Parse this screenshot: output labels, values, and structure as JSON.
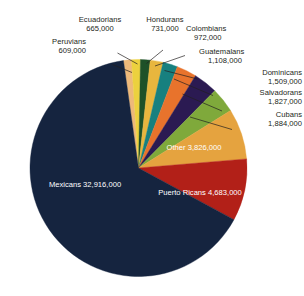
{
  "chart_data": {
    "type": "pie",
    "title": "",
    "subtitle": "",
    "xlabel": "",
    "ylabel": "",
    "legend_position": "none",
    "grid": false,
    "total": 50730000,
    "units": "people",
    "categories": [
      "Mexicans",
      "Puerto Ricans",
      "Other",
      "Cubans",
      "Salvadorans",
      "Dominicans",
      "Guatemalans",
      "Colombians",
      "Hondurans",
      "Ecuadorians",
      "Peruvians"
    ],
    "values": [
      32916000,
      4683000,
      3826000,
      1884000,
      1827000,
      1509000,
      1108000,
      972000,
      731000,
      665000,
      609000
    ],
    "labels": [
      "32,916,000",
      "4,683,000",
      "3,826,000",
      "1,884,000",
      "1,827,000",
      "1,509,000",
      "1,108,000",
      "972,000",
      "731,000",
      "665,000",
      "609,000"
    ],
    "colors": [
      "#15243f",
      "#b22018",
      "#e5a33f",
      "#7fa93b",
      "#2b1a52",
      "#e8732c",
      "#17807f",
      "#e8b63e",
      "#1e5128",
      "#ecd13e",
      "#edb97a"
    ],
    "slices": [
      {
        "name": "Mexicans",
        "value": 32916000,
        "label": "32,916,000",
        "color": "#15243f",
        "label_placement": "inside",
        "label_color": "#ffffff"
      },
      {
        "name": "Puerto Ricans",
        "value": 4683000,
        "label": "4,683,000",
        "color": "#b22018",
        "label_placement": "inside",
        "label_color": "#ffffff"
      },
      {
        "name": "Other",
        "value": 3826000,
        "label": "3,826,000",
        "color": "#e5a33f",
        "label_placement": "inside",
        "label_color": "#ffffff"
      },
      {
        "name": "Cubans",
        "value": 1884000,
        "label": "1,884,000",
        "color": "#7fa93b",
        "label_placement": "callout",
        "label_color": "#231f20"
      },
      {
        "name": "Salvadorans",
        "value": 1827000,
        "label": "1,827,000",
        "color": "#2b1a52",
        "label_placement": "callout",
        "label_color": "#231f20"
      },
      {
        "name": "Dominicans",
        "value": 1509000,
        "label": "1,509,000",
        "color": "#e8732c",
        "label_placement": "callout",
        "label_color": "#231f20"
      },
      {
        "name": "Guatemalans",
        "value": 1108000,
        "label": "1,108,000",
        "color": "#17807f",
        "label_placement": "callout",
        "label_color": "#231f20"
      },
      {
        "name": "Colombians",
        "value": 972000,
        "label": "972,000",
        "color": "#e8b63e",
        "label_placement": "callout",
        "label_color": "#231f20"
      },
      {
        "name": "Hondurans",
        "value": 731000,
        "label": "731,000",
        "color": "#1e5128",
        "label_placement": "callout",
        "label_color": "#231f20"
      },
      {
        "name": "Ecuadorians",
        "value": 665000,
        "label": "665,000",
        "color": "#ecd13e",
        "label_placement": "callout",
        "label_color": "#231f20"
      },
      {
        "name": "Peruvians",
        "value": 609000,
        "label": "609,000",
        "color": "#edb97a",
        "label_placement": "callout",
        "label_color": "#231f20"
      }
    ]
  },
  "callouts": {
    "peruvians": {
      "name": "Peruvians",
      "value": "609,000"
    },
    "ecuadorians": {
      "name": "Ecuadorians",
      "value": "665,000"
    },
    "hondurans": {
      "name": "Hondurans",
      "value": "731,000"
    },
    "colombians": {
      "name": "Colombians",
      "value": "972,000"
    },
    "guatemalans": {
      "name": "Guatemalans",
      "value": "1,108,000"
    },
    "dominicans": {
      "name": "Dominicans",
      "value": "1,509,000"
    },
    "salvadorans": {
      "name": "Salvadorans",
      "value": "1,827,000"
    },
    "cubans": {
      "name": "Cubans",
      "value": "1,884,000"
    }
  },
  "inside_labels": {
    "mexicans": {
      "name": "Mexicans",
      "value": "32,916,000"
    },
    "puerto_ricans": {
      "name": "Puerto Ricans",
      "value": "4,683,000"
    },
    "other": {
      "name": "Other",
      "value": "3,826,000"
    }
  }
}
